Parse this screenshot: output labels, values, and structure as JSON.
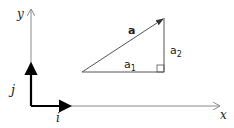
{
  "diagram": {
    "axes": {
      "x_label": "x",
      "y_label": "y"
    },
    "unit_vectors": {
      "i_label": "i",
      "j_label": "j"
    },
    "triangle": {
      "hypotenuse_label": "a",
      "horizontal_label": "a",
      "horizontal_sub": "1",
      "vertical_label": "a",
      "vertical_sub": "2"
    },
    "colors": {
      "axis": "#8a8a8a",
      "unit_vector": "#000000",
      "triangle": "#555555"
    }
  }
}
